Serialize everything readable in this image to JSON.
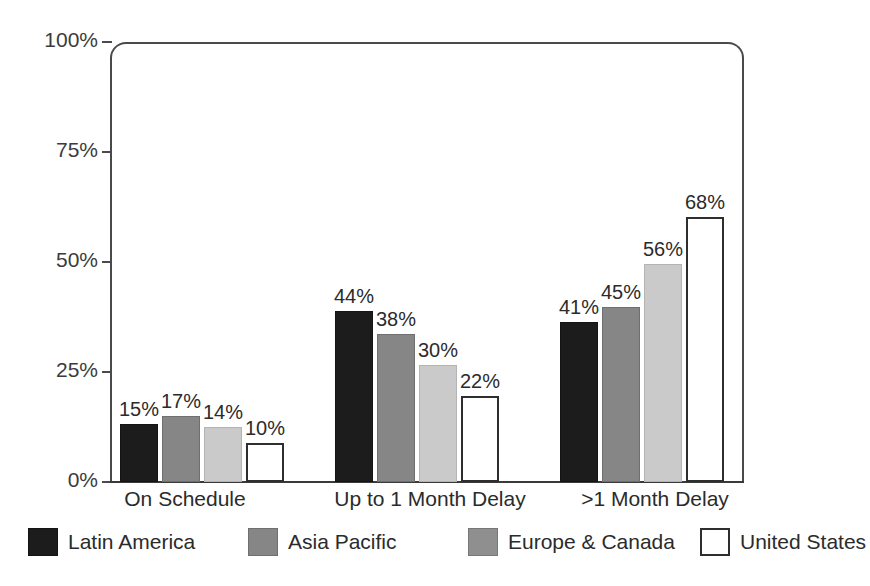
{
  "chart_data": {
    "type": "bar",
    "title": "",
    "xlabel": "",
    "ylabel": "",
    "ylim": [
      0,
      100
    ],
    "grid": false,
    "legend_position": "bottom",
    "categories": [
      "On Schedule",
      "Up to 1 Month Delay",
      ">1 Month Delay"
    ],
    "ytick_labels": [
      "100%",
      "75%",
      "50%",
      "25%",
      "0%"
    ],
    "ytick_values": [
      100,
      75,
      50,
      25,
      0
    ],
    "series": [
      {
        "name": "Latin America",
        "color": "#1c1c1c",
        "values": [
          15,
          44,
          41
        ],
        "labels": [
          "15%",
          "44%",
          "41%"
        ]
      },
      {
        "name": "Asia Pacific",
        "color": "#868686",
        "values": [
          17,
          38,
          45
        ],
        "labels": [
          "17%",
          "38%",
          "45%"
        ]
      },
      {
        "name": "Europe & Canada",
        "color": "#cacaca",
        "values": [
          14,
          30,
          56
        ],
        "labels": [
          "14%",
          "30%",
          "56%"
        ]
      },
      {
        "name": "United States",
        "color": "#ffffff",
        "values": [
          10,
          22,
          68
        ],
        "labels": [
          "10%",
          "22%",
          "68%"
        ]
      }
    ]
  },
  "legend": {
    "items": [
      {
        "label": "Latin America"
      },
      {
        "label": "Asia Pacific"
      },
      {
        "label": "Europe & Canada"
      },
      {
        "label": "United States"
      }
    ]
  }
}
